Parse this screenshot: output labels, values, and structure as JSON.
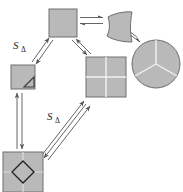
{
  "figure": {
    "background_color": "#ffffff",
    "shape_fill": "#b9b9b9",
    "shape_stroke": "#6e6e6e",
    "arrow_color": "#555555",
    "label_color": "#262626",
    "width": 183,
    "height": 192
  },
  "labels": {
    "s_delta_upper": {
      "base": "S",
      "subscript": "Δ"
    },
    "s_delta_lower": {
      "base": "S",
      "subscript": "Δ"
    }
  },
  "nodes": [
    {
      "id": "top-square",
      "name": "plain-square",
      "kind": "square",
      "x": 49,
      "y": 9,
      "w": 28,
      "h": 28,
      "subdivisions": 0
    },
    {
      "id": "curved-quad",
      "name": "curved-quadrilateral",
      "kind": "curved-quad",
      "x": 106,
      "y": 12,
      "w": 26,
      "h": 30,
      "subdivisions": 0
    },
    {
      "id": "circle-thirds",
      "name": "circle-three-sectors",
      "kind": "circle",
      "cx": 156,
      "cy": 64,
      "r": 24,
      "subdivisions": 3
    },
    {
      "id": "small-square-triangle",
      "name": "small-square-with-corner-triangle",
      "kind": "square",
      "x": 11,
      "y": 65,
      "w": 24,
      "h": 24,
      "subdivisions": 0,
      "corner_triangle": true
    },
    {
      "id": "quad-square",
      "name": "square-four-quadrants",
      "kind": "square",
      "x": 86,
      "y": 57,
      "w": 40,
      "h": 40,
      "subdivisions": 4
    },
    {
      "id": "diamond-square",
      "name": "square-with-center-diamond",
      "kind": "square",
      "x": 3,
      "y": 152,
      "w": 40,
      "h": 40,
      "subdivisions": 4,
      "center_diamond": true
    }
  ],
  "edges": [
    {
      "id": "e1",
      "name": "edge-top-square-to-curved-quad",
      "from": "top-square",
      "to": "curved-quad",
      "type": "reversible-pair",
      "orientation": "horizontal"
    },
    {
      "id": "e2",
      "name": "edge-curved-quad-to-circle",
      "from": "curved-quad",
      "to": "circle-thirds",
      "type": "reversible-pair",
      "orientation": "diagonal-down-right"
    },
    {
      "id": "e3",
      "name": "edge-small-square-to-top-square",
      "from": "small-square-triangle",
      "to": "top-square",
      "type": "reversible-pair",
      "orientation": "diagonal-up-right",
      "label": "s_delta_upper"
    },
    {
      "id": "e4",
      "name": "edge-top-square-to-quad-square",
      "from": "top-square",
      "to": "quad-square",
      "type": "reversible-pair",
      "orientation": "diagonal-down-right"
    },
    {
      "id": "e5",
      "name": "edge-diamond-square-to-small-square",
      "from": "diamond-square",
      "to": "small-square-triangle",
      "type": "reversible-pair",
      "orientation": "vertical"
    },
    {
      "id": "e6",
      "name": "edge-diamond-square-to-quad-square",
      "from": "diamond-square",
      "to": "quad-square",
      "type": "reversible-pair",
      "orientation": "diagonal-up-right",
      "label": "s_delta_lower"
    }
  ]
}
